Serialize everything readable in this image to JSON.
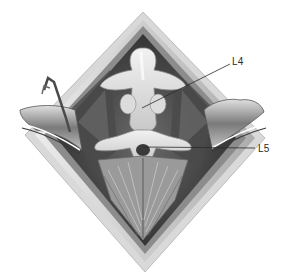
{
  "figure": {
    "labels": [
      {
        "id": "l4",
        "text": "L4"
      },
      {
        "id": "l5",
        "text": "L5"
      }
    ],
    "colors": {
      "background": "#ffffff",
      "skin_edge": "#b8b8b8",
      "tissue_dark": "#3a3a3a",
      "bone": "#e6e6e6",
      "muscle": "#8a8a8a",
      "leader_line": "#2a2a2a"
    }
  }
}
